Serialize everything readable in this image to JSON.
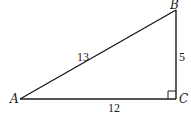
{
  "figure": {
    "type": "right-triangle",
    "vertices": {
      "A": {
        "label": "A",
        "x": 20,
        "y": 99
      },
      "B": {
        "label": "B",
        "x": 176,
        "y": 10
      },
      "C": {
        "label": "C",
        "x": 176,
        "y": 99
      }
    },
    "sides": {
      "AB": {
        "label": "13"
      },
      "BC": {
        "label": "5"
      },
      "AC": {
        "label": "12"
      }
    },
    "right_angle_at": "C",
    "colors": {
      "stroke": "#1a1a1a",
      "background": "#ffffff"
    }
  }
}
